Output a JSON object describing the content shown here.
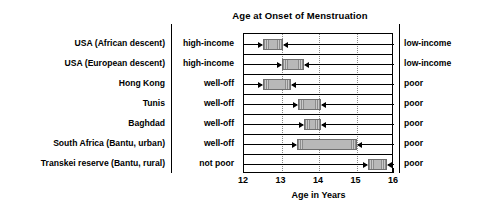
{
  "chart_data": {
    "type": "bar",
    "title": "Age at Onset of Menstruation",
    "xlabel": "Age in Years",
    "ylabel": "",
    "xlim": [
      12,
      16
    ],
    "xticks": [
      12,
      13,
      14,
      15,
      16
    ],
    "xtick_labels": [
      "12",
      "13",
      "14",
      "15",
      "16"
    ],
    "grid": "vertical dotted gridlines at 13, 14, 15",
    "orientation": "horizontal",
    "note": "Each horizontal bar spans the range of mean menarche age between the better-off group (left label) and the poorer group (right label); arrows from each side point to the bar ends.",
    "left_axis_header": "",
    "categories": [
      "USA (African descent)",
      "USA (European descent)",
      "Hong Kong",
      "Tunis",
      "Baghdad",
      "South Africa (Bantu, urban)",
      "Transkei reserve (Bantu, rural)"
    ],
    "left_group_labels": [
      "high-income",
      "high-income",
      "well-off",
      "well-off",
      "well-off",
      "well-off",
      "not poor"
    ],
    "right_group_labels": [
      "low-income",
      "low-income",
      "poor",
      "poor",
      "poor",
      "poor",
      "poor"
    ],
    "bars": [
      {
        "category": "USA (African descent)",
        "start": 12.5,
        "end": 13.05,
        "left_group": "high-income",
        "right_group": "low-income"
      },
      {
        "category": "USA (European descent)",
        "start": 13.0,
        "end": 13.6,
        "left_group": "high-income",
        "right_group": "low-income"
      },
      {
        "category": "Hong Kong",
        "start": 12.5,
        "end": 13.25,
        "left_group": "well-off",
        "right_group": "poor"
      },
      {
        "category": "Tunis",
        "start": 13.45,
        "end": 14.05,
        "left_group": "well-off",
        "right_group": "poor"
      },
      {
        "category": "Baghdad",
        "start": 13.6,
        "end": 14.05,
        "left_group": "well-off",
        "right_group": "poor"
      },
      {
        "category": "South Africa (Bantu, urban)",
        "start": 13.4,
        "end": 15.0,
        "left_group": "well-off",
        "right_group": "poor"
      },
      {
        "category": "Transkei reserve (Bantu, rural)",
        "start": 15.3,
        "end": 15.8,
        "left_group": "not poor",
        "right_group": "poor"
      }
    ]
  }
}
